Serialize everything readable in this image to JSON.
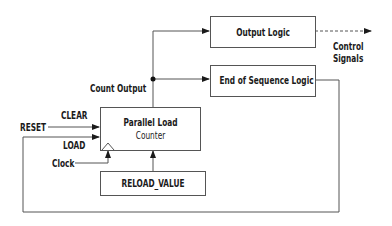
{
  "diagram": {
    "blocks": {
      "counter": {
        "line1": "Parallel Load",
        "line2": "Counter"
      },
      "output_logic": "Output Logic",
      "end_of_sequence": "End of Sequence Logic",
      "reload_value": "RELOAD_VALUE"
    },
    "labels": {
      "count_output": "Count Output",
      "control_signals_1": "Control",
      "control_signals_2": "Signals",
      "reset": "RESET",
      "clear": "CLEAR",
      "load": "LOAD",
      "clock": "Clock"
    },
    "colors": {
      "line": "#555555",
      "text": "#1a1a1a",
      "background": "#ffffff"
    }
  }
}
